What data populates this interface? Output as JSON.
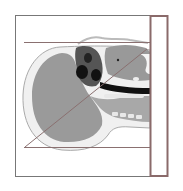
{
  "figure": {
    "colors": {
      "frame": "#777777",
      "bar_border": "#8a6a6a",
      "tissue": "#9a9a9a",
      "bone": "#f2f2f2",
      "dark": "#1a1a1a",
      "line": "#8a7070"
    }
  }
}
